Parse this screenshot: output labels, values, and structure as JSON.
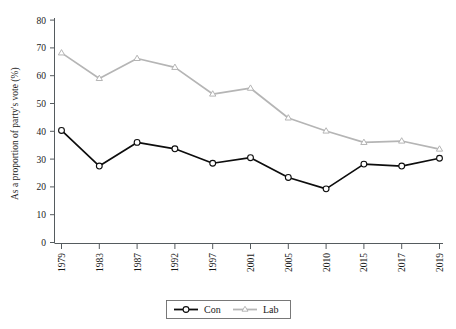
{
  "chart_data": {
    "type": "line",
    "title": "",
    "xlabel": "",
    "ylabel": "As a proportion of party's vote (%)",
    "categories": [
      "1979",
      "1983",
      "1987",
      "1992",
      "1997",
      "2001",
      "2005",
      "2010",
      "2015",
      "2017",
      "2019"
    ],
    "series": [
      {
        "name": "Con",
        "color": "#0d0d0d",
        "marker": "circle",
        "values": [
          40.3,
          27.5,
          36.0,
          33.7,
          28.5,
          30.5,
          23.4,
          19.3,
          28.2,
          27.5,
          30.3
        ]
      },
      {
        "name": "Lab",
        "color": "#b5b5b5",
        "marker": "triangle",
        "values": [
          68.2,
          59.0,
          66.2,
          63.0,
          53.4,
          55.5,
          44.8,
          40.1,
          36.0,
          36.5,
          33.6
        ]
      }
    ],
    "ylim": [
      0,
      80
    ],
    "yticks": [
      0,
      10,
      20,
      30,
      40,
      50,
      60,
      70,
      80
    ],
    "ytick_labels": [
      "0",
      "10",
      "20",
      "30",
      "40",
      "50",
      "60",
      "70",
      "80"
    ],
    "grid": false,
    "legend_position": "bottom-center"
  },
  "legend": {
    "entries": [
      {
        "label": "Con"
      },
      {
        "label": "Lab"
      }
    ]
  },
  "axes": {
    "y_label": "As a proportion of party's vote (%)",
    "y_tick_0": "0",
    "y_tick_10": "10",
    "y_tick_20": "20",
    "y_tick_30": "30",
    "y_tick_40": "40",
    "y_tick_50": "50",
    "y_tick_60": "60",
    "y_tick_70": "70",
    "y_tick_80": "80",
    "x_tick_0": "1979",
    "x_tick_1": "1983",
    "x_tick_2": "1987",
    "x_tick_3": "1992",
    "x_tick_4": "1997",
    "x_tick_5": "2001",
    "x_tick_6": "2005",
    "x_tick_7": "2010",
    "x_tick_8": "2015",
    "x_tick_9": "2017",
    "x_tick_10": "2019"
  },
  "colors": {
    "con": "#0d0d0d",
    "lab": "#b5b5b5",
    "axis": "#555b5e",
    "background": "#ffffff"
  }
}
